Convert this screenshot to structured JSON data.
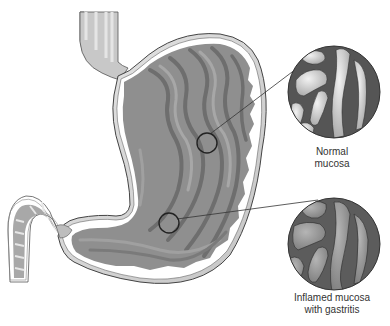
{
  "diagram": {
    "structures": [
      "esophagus",
      "stomach",
      "duodenum",
      "pylorus",
      "gastric folds (rugae)"
    ],
    "callouts": [
      {
        "id": "normal",
        "label_line1": "Normal",
        "label_line2": "mucosa",
        "marker_center": [
          207,
          143
        ],
        "detail_center": [
          334,
          92
        ],
        "detail_radius": 46
      },
      {
        "id": "inflamed",
        "label_line1": "Inflamed mucosa",
        "label_line2": "with gastritis",
        "marker_center": [
          169,
          223
        ],
        "detail_center": [
          334,
          244
        ],
        "detail_radius": 46
      }
    ]
  },
  "colors": {
    "background": "#ffffff",
    "stomach_wall": "#d9d9d9",
    "mucosa": "#8f8f8f",
    "rugae_dark": "#6e6e6e",
    "rugae_light": "#a7a7a7",
    "normal_detail_bg": "#555555",
    "normal_detail_fold": "#d8d8d8",
    "inflamed_detail_bg": "#5c5c5c",
    "inflamed_detail_fold": "#9a9a9a",
    "outline": "#333333",
    "text": "#333333"
  }
}
